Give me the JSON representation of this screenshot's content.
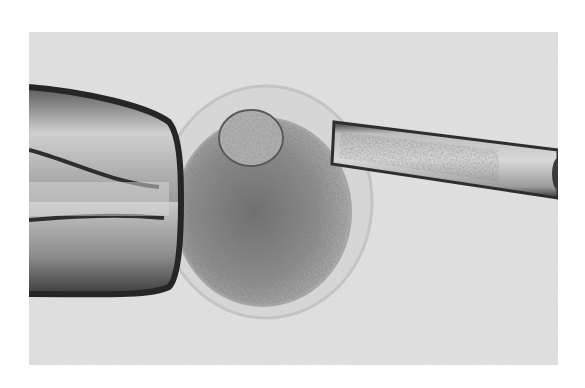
{
  "image": {
    "subject": "micrograph of intracytoplasmic sperm injection (oocyte held by pipette, injection needle on right)",
    "elements": [
      {
        "name": "holding-pipette",
        "position": "left"
      },
      {
        "name": "oocyte",
        "position": "center"
      },
      {
        "name": "polar-body",
        "position": "top of oocyte"
      },
      {
        "name": "zona-pellucida",
        "position": "halo around oocyte"
      },
      {
        "name": "injection-needle",
        "position": "right"
      }
    ],
    "colors": {
      "background": "#e6e6e6",
      "page": "#ffffff",
      "cytoplasm": "#8a8a8a",
      "pipette_edge": "#2a2a2a"
    }
  }
}
